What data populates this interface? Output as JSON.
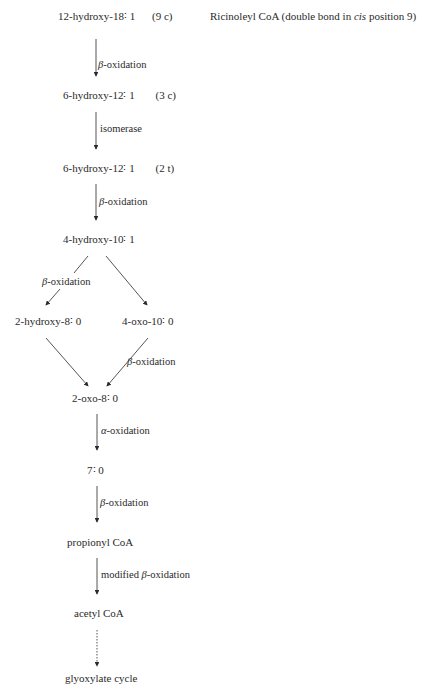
{
  "note": {
    "text_before_italic": "Ricinoleyl CoA (double bond in ",
    "italic": "cis",
    "text_after_italic": " position 9)"
  },
  "nodes": {
    "n1": {
      "name": "12-hydroxy-18∶ 1",
      "config": "(9 c)"
    },
    "n2": {
      "name": "6-hydroxy-12∶ 1",
      "config": "(3 c)"
    },
    "n3": {
      "name": "6-hydroxy-12∶ 1",
      "config": "(2 t)"
    },
    "n4": {
      "name": "4-hydroxy-10∶ 1"
    },
    "n5a": {
      "name": "2-hydroxy-8∶ 0"
    },
    "n5b": {
      "name": "4-oxo-10∶ 0"
    },
    "n6": {
      "name": "2-oxo-8∶ 0"
    },
    "n7": {
      "name": "7∶ 0"
    },
    "n8": {
      "name": "propionyl CoA"
    },
    "n9": {
      "name": "acetyl CoA"
    },
    "n10": {
      "name": "glyoxylate cycle"
    }
  },
  "steps": {
    "s1": {
      "greek": "β",
      "text": "-oxidation"
    },
    "s2": {
      "text": "isomerase"
    },
    "s3": {
      "greek": "β",
      "text": "-oxidation"
    },
    "s4a": {
      "greek": "β",
      "text": "-oxidation"
    },
    "s5b": {
      "greek": "β",
      "text": "-oxidation"
    },
    "s6": {
      "greek": "α",
      "text": "-oxidation"
    },
    "s7": {
      "greek": "β",
      "text": "-oxidation"
    },
    "s8": {
      "prefix": "modified ",
      "greek": "β",
      "text": "-oxidation"
    }
  },
  "colors": {
    "ink": "#2a2a2a",
    "background": "#ffffff"
  }
}
